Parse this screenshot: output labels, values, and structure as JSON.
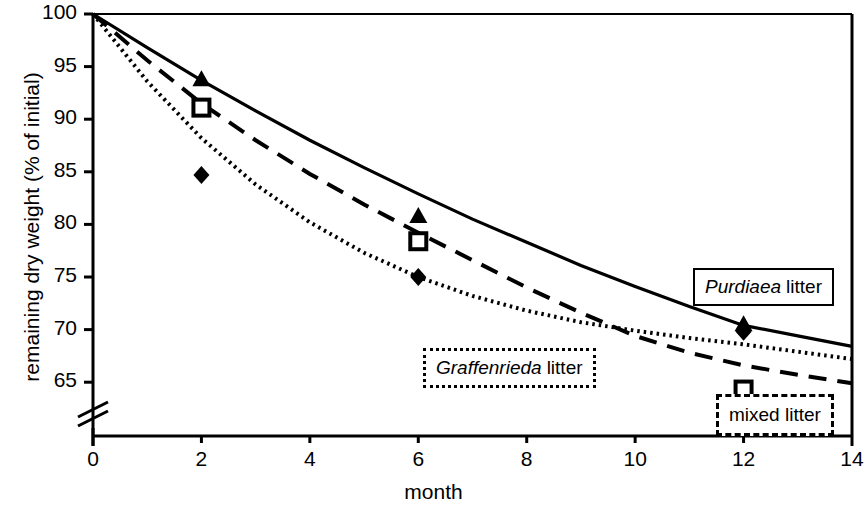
{
  "chart_data": {
    "type": "line",
    "title": "",
    "xlabel": "month",
    "ylabel": "remaining dry weight (% of initial)",
    "xlim": [
      0,
      14
    ],
    "ylim": [
      63,
      100
    ],
    "xticks": [
      0,
      2,
      4,
      6,
      8,
      10,
      12,
      14
    ],
    "yticks": [
      65,
      70,
      75,
      80,
      85,
      90,
      95,
      100
    ],
    "grid": false,
    "axis_break": {
      "axis": "y",
      "below": 65,
      "note": "broken y-axis between 0 and 65"
    },
    "legend_position": "inside-plot-labelled-boxes",
    "series": [
      {
        "name": "Purdiaea litter",
        "name_italic_part": "Purdiaea",
        "name_plain_part": "litter",
        "line_style": "solid",
        "marker": "filled-triangle",
        "color": "#000000",
        "points": [
          {
            "x": 2,
            "y": 93.8
          },
          {
            "x": 6,
            "y": 80.8
          },
          {
            "x": 12,
            "y": 70.5
          }
        ],
        "fit_curve": [
          {
            "x": 0,
            "y": 100.0
          },
          {
            "x": 1,
            "y": 96.8
          },
          {
            "x": 2,
            "y": 93.7
          },
          {
            "x": 3,
            "y": 90.8
          },
          {
            "x": 4,
            "y": 88.0
          },
          {
            "x": 5,
            "y": 85.4
          },
          {
            "x": 6,
            "y": 82.9
          },
          {
            "x": 7,
            "y": 80.5
          },
          {
            "x": 8,
            "y": 78.3
          },
          {
            "x": 9,
            "y": 76.1
          },
          {
            "x": 10,
            "y": 74.1
          },
          {
            "x": 11,
            "y": 72.2
          },
          {
            "x": 12,
            "y": 70.4
          },
          {
            "x": 13,
            "y": 69.4
          },
          {
            "x": 14,
            "y": 68.4
          }
        ]
      },
      {
        "name": "mixed litter",
        "name_italic_part": "",
        "name_plain_part": "mixed litter",
        "line_style": "dashed",
        "marker": "open-square",
        "color": "#000000",
        "points": [
          {
            "x": 2,
            "y": 91.1
          },
          {
            "x": 6,
            "y": 78.4
          },
          {
            "x": 12,
            "y": 64.3
          }
        ],
        "fit_curve": [
          {
            "x": 0,
            "y": 100.0
          },
          {
            "x": 1,
            "y": 95.6
          },
          {
            "x": 2,
            "y": 91.5
          },
          {
            "x": 3,
            "y": 88.0
          },
          {
            "x": 4,
            "y": 84.8
          },
          {
            "x": 5,
            "y": 81.9
          },
          {
            "x": 6,
            "y": 79.2
          },
          {
            "x": 7,
            "y": 76.6
          },
          {
            "x": 8,
            "y": 74.0
          },
          {
            "x": 9,
            "y": 71.6
          },
          {
            "x": 10,
            "y": 69.4
          },
          {
            "x": 11,
            "y": 67.8
          },
          {
            "x": 12,
            "y": 66.6
          },
          {
            "x": 13,
            "y": 65.7
          },
          {
            "x": 14,
            "y": 64.9
          }
        ]
      },
      {
        "name": "Graffenrieda litter",
        "name_italic_part": "Graffenrieda",
        "name_plain_part": "litter",
        "line_style": "dotted",
        "marker": "filled-diamond",
        "color": "#000000",
        "points": [
          {
            "x": 2,
            "y": 84.7
          },
          {
            "x": 6,
            "y": 75.0
          },
          {
            "x": 12,
            "y": 69.8
          }
        ],
        "fit_curve": [
          {
            "x": 0,
            "y": 100.0
          },
          {
            "x": 1,
            "y": 93.6
          },
          {
            "x": 2,
            "y": 88.2
          },
          {
            "x": 3,
            "y": 83.8
          },
          {
            "x": 4,
            "y": 80.2
          },
          {
            "x": 5,
            "y": 77.3
          },
          {
            "x": 6,
            "y": 75.0
          },
          {
            "x": 7,
            "y": 73.2
          },
          {
            "x": 8,
            "y": 71.8
          },
          {
            "x": 9,
            "y": 70.7
          },
          {
            "x": 10,
            "y": 69.9
          },
          {
            "x": 11,
            "y": 69.2
          },
          {
            "x": 12,
            "y": 68.6
          },
          {
            "x": 13,
            "y": 67.9
          },
          {
            "x": 14,
            "y": 67.2
          }
        ]
      }
    ]
  },
  "axes": {
    "ylabel": "remaining dry weight (% of initial)",
    "xlabel": "month",
    "ytick_labels": [
      "100",
      "95",
      "90",
      "85",
      "80",
      "75",
      "70",
      "65"
    ],
    "xtick_labels": [
      "0",
      "2",
      "4",
      "6",
      "8",
      "10",
      "12",
      "14"
    ]
  },
  "legend": {
    "purdiaea": {
      "italic": "Purdiaea",
      "plain": "litter"
    },
    "graffenrieda": {
      "italic": "Graffenrieda",
      "plain": "litter"
    },
    "mixed": {
      "italic": "",
      "plain": "mixed litter"
    }
  },
  "colors": {
    "line": "#000000",
    "background": "#ffffff",
    "text": "#000000"
  }
}
